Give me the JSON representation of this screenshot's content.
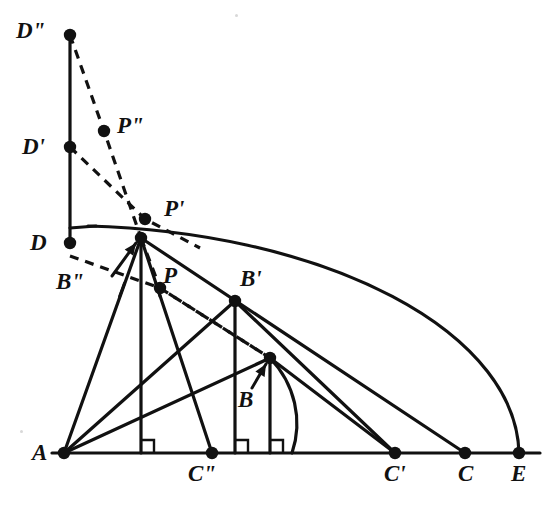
{
  "figure": {
    "width": 556,
    "height": 512,
    "background": "#ffffff",
    "stroke_color": "#111111",
    "dash_pattern": "9 7"
  },
  "points": [
    {
      "id": "A",
      "label": "A",
      "x": 64,
      "y": 453,
      "label_x": 32,
      "label_y": 441,
      "dot": true
    },
    {
      "id": "D",
      "label": "D",
      "x": 70,
      "y": 243,
      "label_x": 30,
      "label_y": 231,
      "dot": true
    },
    {
      "id": "Dp",
      "label": "D'",
      "x": 70,
      "y": 147,
      "label_x": 22,
      "label_y": 135,
      "dot": true
    },
    {
      "id": "Dpp",
      "label": "D\"",
      "x": 70,
      "y": 35,
      "label_x": 16,
      "label_y": 19,
      "dot": true
    },
    {
      "id": "Bpp",
      "label": "B\"",
      "x": 141,
      "y": 238,
      "label_x": 56,
      "label_y": 270,
      "dot": true
    },
    {
      "id": "Bp",
      "label": "B'",
      "x": 235,
      "y": 301,
      "label_x": 240,
      "label_y": 267,
      "dot": true
    },
    {
      "id": "B",
      "label": "B",
      "x": 270,
      "y": 358,
      "label_x": 238,
      "label_y": 388,
      "dot": true
    },
    {
      "id": "P",
      "label": "P",
      "x": 160,
      "y": 288,
      "label_x": 163,
      "label_y": 264,
      "dot": true
    },
    {
      "id": "Pp",
      "label": "P'",
      "x": 145,
      "y": 219,
      "label_x": 164,
      "label_y": 197,
      "dot": true
    },
    {
      "id": "Ppp",
      "label": "P\"",
      "x": 104,
      "y": 131,
      "label_x": 117,
      "label_y": 114,
      "dot": true
    },
    {
      "id": "Cpp",
      "label": "C\"",
      "x": 212,
      "y": 453,
      "label_x": 188,
      "label_y": 462,
      "dot": true
    },
    {
      "id": "Cp",
      "label": "C'",
      "x": 395,
      "y": 453,
      "label_x": 384,
      "label_y": 462,
      "dot": true
    },
    {
      "id": "C",
      "label": "C",
      "x": 465,
      "y": 453,
      "label_x": 458,
      "label_y": 462,
      "dot": true
    },
    {
      "id": "E",
      "label": "E",
      "x": 519,
      "y": 453,
      "label_x": 511,
      "label_y": 462,
      "dot": true
    }
  ],
  "solid_segments": [
    {
      "name": "baseline-A-E",
      "from": [
        52,
        453
      ],
      "to": [
        540,
        453
      ]
    },
    {
      "name": "vertical-D-to-Dpp",
      "from": [
        70,
        243
      ],
      "to": [
        70,
        35
      ]
    },
    {
      "name": "A-to-Bpp",
      "from": [
        64,
        453
      ],
      "to": [
        141,
        238
      ]
    },
    {
      "name": "A-to-Bp",
      "from": [
        64,
        453
      ],
      "to": [
        235,
        301
      ]
    },
    {
      "name": "A-to-B",
      "from": [
        64,
        453
      ],
      "to": [
        270,
        358
      ]
    },
    {
      "name": "Bpp-vertical-foot",
      "from": [
        141,
        238
      ],
      "to": [
        141,
        453
      ]
    },
    {
      "name": "Bpp-to-Cpp",
      "from": [
        141,
        238
      ],
      "to": [
        212,
        453
      ]
    },
    {
      "name": "Bpp-to-C",
      "from": [
        141,
        238
      ],
      "to": [
        465,
        453
      ]
    },
    {
      "name": "Bp-vertical-foot",
      "from": [
        235,
        301
      ],
      "to": [
        235,
        453
      ]
    },
    {
      "name": "Bp-to-Cp",
      "from": [
        235,
        301
      ],
      "to": [
        395,
        453
      ]
    },
    {
      "name": "B-vertical-foot",
      "from": [
        270,
        358
      ],
      "to": [
        270,
        453
      ]
    },
    {
      "name": "B-to-Cp",
      "from": [
        270,
        358
      ],
      "to": [
        395,
        453
      ]
    },
    {
      "name": "D-horizontal-stub",
      "from": [
        70,
        228
      ],
      "to": [
        96,
        226
      ]
    }
  ],
  "dashed_segments": [
    {
      "name": "Dpp-through-Ppp-to-Bpp",
      "points": [
        [
          70,
          35
        ],
        [
          104,
          131
        ],
        [
          141,
          238
        ]
      ]
    },
    {
      "name": "Dp-through-Pp-onward",
      "points": [
        [
          70,
          147
        ],
        [
          145,
          219
        ],
        [
          200,
          248
        ]
      ]
    },
    {
      "name": "D-through-P-to-B",
      "points": [
        [
          70,
          256
        ],
        [
          160,
          288
        ],
        [
          270,
          358
        ]
      ]
    },
    {
      "name": "Bpp-through-P-to-B",
      "points": [
        [
          141,
          238
        ],
        [
          160,
          288
        ],
        [
          270,
          358
        ]
      ]
    }
  ],
  "arcs": [
    {
      "name": "main-arc-D-to-E",
      "from": [
        88,
        226
      ],
      "to": [
        519,
        453
      ],
      "rx": 455,
      "ry": 230,
      "sweep": 1
    },
    {
      "name": "small-arc-B-foot",
      "from": [
        270,
        358
      ],
      "to": [
        292,
        453
      ],
      "rx": 110,
      "ry": 100,
      "sweep": 1
    }
  ],
  "right_angle_marks": [
    {
      "name": "right-angle-at-Bpp-foot",
      "x": 141,
      "y": 453
    },
    {
      "name": "right-angle-at-Bp-foot",
      "x": 235,
      "y": 453
    },
    {
      "name": "right-angle-at-B-foot",
      "x": 270,
      "y": 453
    }
  ],
  "arrow_annotations": [
    {
      "name": "arrow-to-Bpp",
      "from": [
        112,
        276
      ],
      "to": [
        136,
        243
      ]
    },
    {
      "name": "arrow-to-B",
      "from": [
        252,
        388
      ],
      "to": [
        266,
        364
      ]
    }
  ],
  "tick_marks": [
    {
      "name": "tick-on-A-Bpp",
      "x": 122,
      "y": 290,
      "angle": -70
    },
    {
      "name": "tick-on-Bpp-Cpp",
      "x": 158,
      "y": 290,
      "angle": 72
    }
  ],
  "specks": [
    {
      "name": "dust-speck-top",
      "x": 235,
      "y": 14
    },
    {
      "name": "dust-speck-left",
      "x": 20,
      "y": 430
    }
  ]
}
